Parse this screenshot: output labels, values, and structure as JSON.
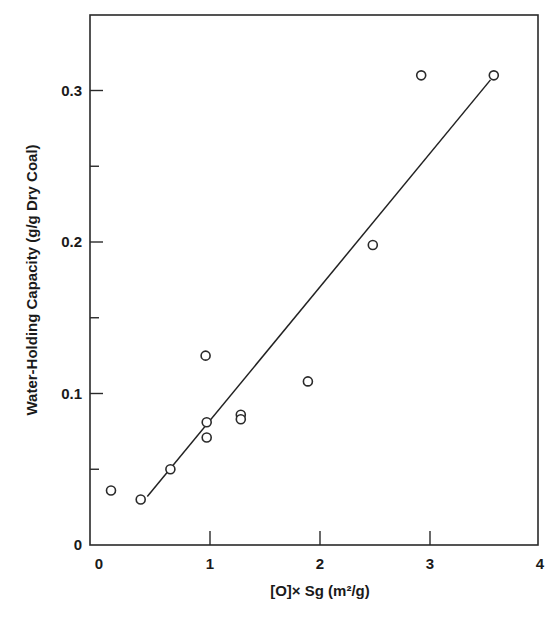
{
  "chart_data": {
    "type": "scatter",
    "title": "",
    "xlabel": "[O]× Sg (m²/g)",
    "ylabel": "Water-Holding Capacity (g/g Dry Coal)",
    "xlim": [
      0,
      4
    ],
    "ylim": [
      0,
      0.34
    ],
    "x_ticks": [
      0,
      1,
      2,
      3,
      4
    ],
    "x_tick_labels": [
      "0",
      "1",
      "2",
      "3",
      "4"
    ],
    "y_ticks": [
      0,
      0.05,
      0.1,
      0.15,
      0.2,
      0.25,
      0.3
    ],
    "y_tick_labels": [
      "0",
      "",
      "0.1",
      "",
      "0.2",
      "",
      "0.3"
    ],
    "grid": false,
    "legend": null,
    "series": [
      {
        "name": "Coal samples",
        "marker": "open-circle",
        "points": [
          {
            "x": 0.1,
            "y": 0.036
          },
          {
            "x": 0.37,
            "y": 0.03
          },
          {
            "x": 0.64,
            "y": 0.05
          },
          {
            "x": 0.96,
            "y": 0.125
          },
          {
            "x": 0.97,
            "y": 0.081
          },
          {
            "x": 0.97,
            "y": 0.071
          },
          {
            "x": 1.28,
            "y": 0.086
          },
          {
            "x": 1.28,
            "y": 0.083
          },
          {
            "x": 1.89,
            "y": 0.108
          },
          {
            "x": 2.48,
            "y": 0.198
          },
          {
            "x": 2.92,
            "y": 0.31
          },
          {
            "x": 3.58,
            "y": 0.31
          }
        ]
      },
      {
        "name": "Linear fit",
        "type": "line",
        "points": [
          {
            "x": 0.43,
            "y": 0.032
          },
          {
            "x": 3.55,
            "y": 0.307
          }
        ]
      }
    ]
  }
}
